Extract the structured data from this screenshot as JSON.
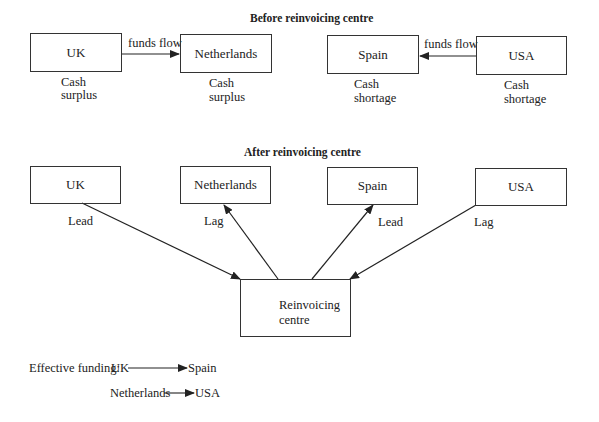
{
  "before": {
    "title": "Before reinvoicing centre",
    "nodes": [
      {
        "label": "UK",
        "note_line1": "Cash",
        "note_line2": "surplus"
      },
      {
        "label": "Netherlands",
        "note_line1": "Cash",
        "note_line2": "surplus"
      },
      {
        "label": "Spain",
        "note_line1": "Cash",
        "note_line2": "shortage"
      },
      {
        "label": "USA",
        "note_line1": "Cash",
        "note_line2": "shortage"
      }
    ],
    "flows": [
      {
        "from": "UK",
        "to": "Netherlands",
        "label": "funds flow"
      },
      {
        "from": "USA",
        "to": "Spain",
        "label": "funds flow"
      }
    ]
  },
  "after": {
    "title": "After reinvoicing centre",
    "nodes": [
      {
        "label": "UK",
        "edge_label": "Lead"
      },
      {
        "label": "Netherlands",
        "edge_label": "Lag"
      },
      {
        "label": "Spain",
        "edge_label": "Lead"
      },
      {
        "label": "USA",
        "edge_label": "Lag"
      }
    ],
    "centre": {
      "line1": "Reinvoicing",
      "line2": "centre"
    },
    "edges": [
      {
        "from": "UK",
        "to": "Reinvoicing centre",
        "label": "Lead"
      },
      {
        "from": "Reinvoicing centre",
        "to": "Netherlands",
        "label": "Lag"
      },
      {
        "from": "Reinvoicing centre",
        "to": "Spain",
        "label": "Lead"
      },
      {
        "from": "USA",
        "to": "Reinvoicing centre",
        "label": "Lag"
      }
    ]
  },
  "effective": {
    "prefix": "Effective funding:",
    "row1": {
      "from": "UK",
      "to": "Spain"
    },
    "row2": {
      "from": "Netherlands",
      "to": "USA"
    }
  }
}
